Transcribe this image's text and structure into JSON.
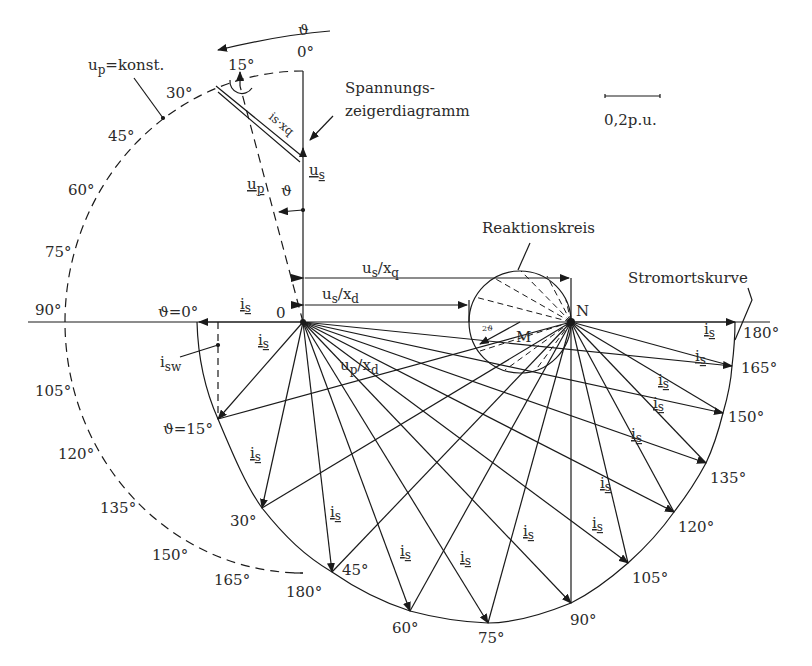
{
  "diagram": {
    "title_labels": {
      "voltage_diagram": [
        "Spannungs-",
        "zeigerdiagramm"
      ],
      "reaction_circle": "Reaktionskreis",
      "current_locus": "Stromortskurve",
      "scale": "0,2p.u.",
      "up_const": "u",
      "up_const_sub": "p",
      "up_const_rest": "=konst.",
      "origin": "0",
      "point_N": "N",
      "point_M": "M",
      "theta": "ϑ",
      "two_theta": "2ϑ",
      "is_label": "i",
      "is_sub": "s",
      "isw_label": "i",
      "isw_sub": "sw",
      "us_label": "u",
      "us_sub": "s",
      "up_label": "u",
      "up_sub": "p",
      "isxq": "is·xq",
      "us_xq": "u",
      "us_xq_sub1": "s",
      "us_xq_mid": "/x",
      "us_xq_sub2": "q",
      "us_xd_sub2": "d",
      "up_xd_sub1": "p",
      "theta0": "ϑ=0°",
      "theta15": "ϑ=15°"
    },
    "voltage_angles": [
      "0°",
      "15°",
      "30°",
      "45°",
      "60°",
      "75°",
      "90°",
      "105°",
      "120°",
      "135°",
      "150°",
      "165°",
      "180°"
    ],
    "current_angles": [
      "30°",
      "45°",
      "60°",
      "75°",
      "90°",
      "105°",
      "120°",
      "135°",
      "150°",
      "165°",
      "180°"
    ]
  }
}
